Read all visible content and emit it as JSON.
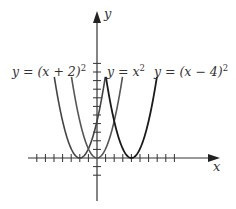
{
  "chart_data": {
    "type": "line",
    "title": "",
    "xlabel": "x",
    "ylabel": "y",
    "grid": false,
    "x_ticks_count_left_of_origin": 7,
    "x_ticks_count_right_of_origin": 9,
    "y_ticks_count_above_origin": 11,
    "y_ticks_count_below_origin": 2,
    "xlim": [
      -8,
      14
    ],
    "ylim": [
      -5,
      16
    ],
    "series": [
      {
        "name": "y = (x + 2)²",
        "label": "y = (x + 2)",
        "exponent": "2",
        "function": "(x+2)^2",
        "vertex": [
          -2,
          0
        ],
        "color": "#444444"
      },
      {
        "name": "y = x²",
        "label": "y = x",
        "exponent": "2",
        "function": "x^2",
        "vertex": [
          0,
          0
        ],
        "color": "#555555"
      },
      {
        "name": "y = (x − 4)²",
        "label": "y = (x − 4)",
        "exponent": "2",
        "function": "(x-4)^2",
        "vertex": [
          4,
          0
        ],
        "color": "#1a1a1a"
      }
    ]
  },
  "labels": {
    "x_axis": "x",
    "y_axis": "y",
    "eq1": "y = (x + 2)",
    "eq2": "y = x",
    "eq3": "y = (x − 4)",
    "sup": "2"
  },
  "colors": {
    "axis": "#333333",
    "curve1": "#444444",
    "curve2": "#555555",
    "curve3": "#1a1a1a"
  }
}
